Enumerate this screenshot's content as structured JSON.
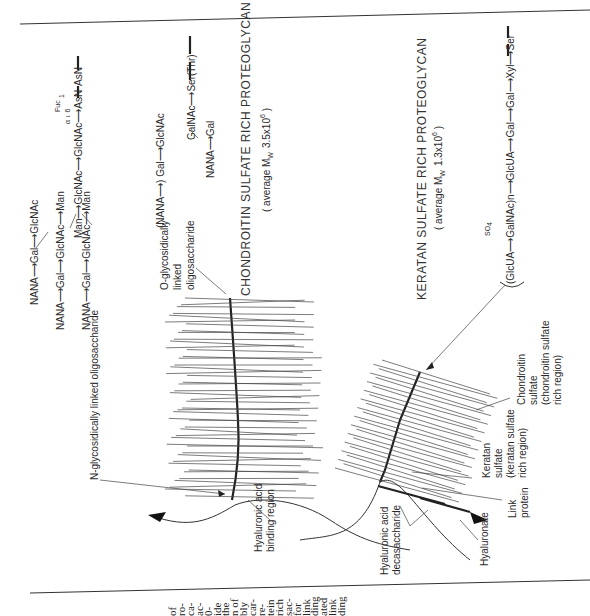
{
  "figure": {
    "orientation": "rotated 90 degrees counter-clockwise",
    "chondroitin_title": "CHONDROITIN  SULFATE  RICH  PROTEOGLYCAN",
    "chondroitin_mw": "( average M",
    "chondroitin_mw_sub": "W",
    "chondroitin_mw_val": "3.5x10",
    "chondroitin_mw_exp": "6",
    "chondroitin_mw_close": " )",
    "keratan_title": "KERATAN  SULFATE  RICH  PROTEOGLYCAN",
    "keratan_mw": "( average M",
    "keratan_mw_sub": "W",
    "keratan_mw_val": "1.3x10",
    "keratan_mw_exp": "6",
    "keratan_mw_close": " )"
  },
  "labels": {
    "n_glyco": "N-glycosidically  linked  oligosaccharide",
    "o_glyco_1": "O-glycosidically",
    "o_glyco_2": "linked",
    "o_glyco_3": "oligosaccharide",
    "ha_binding_1": "Hyaluronic acid",
    "ha_binding_2": "binding region",
    "ha_deca_1": "Hyaluronic acid",
    "ha_deca_2": "decasaccharide",
    "hyaluronate": "Hyaluronate",
    "link_1": "Link",
    "link_2": "protein",
    "ks_1": "Keratan",
    "ks_2": "sulfate",
    "ks_3": "(keratan sulfate",
    "ks_4": "rich region)",
    "cs_1": "Chondroitin",
    "cs_2": "sulfate",
    "cs_3": "(chondroitin sulfate",
    "cs_4": "rich region)"
  },
  "n_linked_chain": {
    "branch1": [
      "NANA",
      "2",
      "α",
      "3",
      "Gal",
      "1",
      "β",
      "4",
      "GlcNAc"
    ],
    "branch2": [
      "NANA",
      "α",
      "Gal",
      "1",
      "β",
      "4",
      "GlcNAc",
      "1",
      "β",
      "3",
      "Man"
    ],
    "branch3": [
      "NANA",
      "2",
      "α",
      "3",
      "Gal",
      "1",
      "β",
      "4",
      "GlcNAc",
      "1",
      "β",
      "2",
      "Man"
    ],
    "core": [
      "Man",
      "1",
      "β",
      "4",
      "GlcNAc",
      "1",
      "β",
      "4",
      "GlcNAc",
      "1",
      "AsN"
    ],
    "fucose": [
      "Fuc",
      "1",
      "α",
      "6"
    ],
    "text_branch1": "NANA⟶Gal⟶GlcNAc",
    "text_branch2": "NANA⟶Gal⟶GlcNAc⟶Man",
    "text_branch3": "NANA⟶Gal⟶GlcNAc⟶Man",
    "text_core": "Man⟶GlcNAc⟶GlcNAc⟶AsN",
    "attach": "AsN"
  },
  "o_linked_chain": {
    "top": "(NANA⟶) Gal⟶GlcNAc",
    "top_links": [
      "2",
      "α",
      "3",
      "1",
      "β",
      "4"
    ],
    "core": "GalNAc⟶Ser(Thr)",
    "core_links": [
      "6",
      "1",
      "β",
      "1"
    ],
    "bottom": "NANA⟶Gal",
    "bottom_links": [
      "α",
      "2",
      "3",
      "β",
      "1",
      "3"
    ]
  },
  "linkage_region": {
    "text": "(GlcUA⟶GalNAc)n⟶GlcUA⟶Gal⟶Gal⟶Xyl⟶Ser",
    "units": [
      "GlcUA",
      "GalNAc",
      "GlcUA",
      "Gal",
      "Gal",
      "Xyl",
      "Ser"
    ],
    "sulfate": "SO",
    "sulfate_sub": "4",
    "repeat": "n",
    "links": [
      "1",
      "β",
      "3",
      "4",
      "1",
      "β",
      "4",
      "1",
      "β",
      "3",
      "1",
      "β",
      "3",
      "1",
      "β",
      "4",
      "1"
    ]
  },
  "page_text_fragments": [
    "of",
    "ro-",
    "ca-",
    "ac-",
    "0-",
    "ide",
    "the",
    "n of",
    "bly",
    "car-",
    "re-",
    "tein",
    "rich",
    "sac-",
    "for",
    "link",
    "ding",
    "ated",
    "link",
    "ding"
  ]
}
